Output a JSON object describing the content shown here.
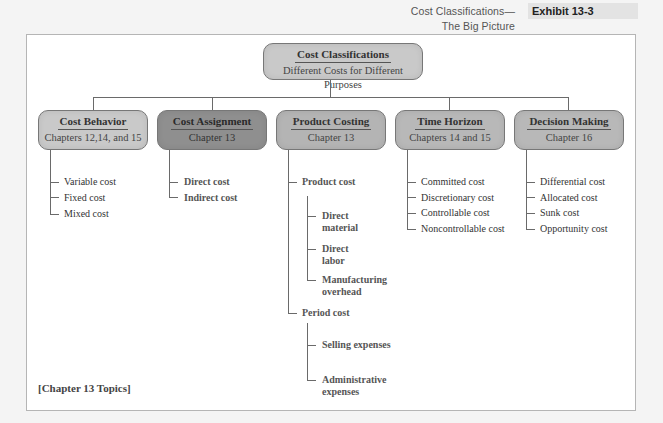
{
  "header": {
    "title": "Cost Classifications—The Big Picture",
    "exhibit": "Exhibit 13-3"
  },
  "root": {
    "title": "Cost Classifications",
    "subtitle": "Different Costs for Different Purposes"
  },
  "categories": [
    {
      "title": "Cost Behavior",
      "subtitle": "Chapters 12,14, and 15",
      "items": [
        "Variable cost",
        "Fixed cost",
        "Mixed cost"
      ]
    },
    {
      "title": "Cost Assignment",
      "subtitle": "Chapter 13",
      "items": [
        "Direct cost",
        "Indirect cost"
      ]
    },
    {
      "title": "Product Costing",
      "subtitle": "Chapter 13",
      "groups": [
        {
          "label": "Product cost",
          "items": [
            "Direct material",
            "Direct labor",
            "Manufacturing overhead"
          ],
          "items_display": [
            [
              "Direct",
              "material"
            ],
            [
              "Direct",
              "labor"
            ],
            [
              "Manufacturing",
              "overhead"
            ]
          ]
        },
        {
          "label": "Period cost",
          "items": [
            "Selling expenses",
            "Administrative expenses"
          ],
          "items_display": [
            [
              "Selling expenses"
            ],
            [
              "Administrative",
              "expenses"
            ]
          ]
        }
      ]
    },
    {
      "title": "Time Horizon",
      "subtitle": "Chapters 14 and 15",
      "items": [
        "Committed cost",
        "Discretionary cost",
        "Controllable cost",
        "Noncontrollable cost"
      ]
    },
    {
      "title": "Decision Making",
      "subtitle": "Chapter 16",
      "items": [
        "Differential cost",
        "Allocated cost",
        "Sunk cost",
        "Opportunity cost"
      ]
    }
  ],
  "footer": {
    "note": "[Chapter 13 Topics]"
  },
  "colors": {
    "box_fill": "#c9c9c9",
    "highlight_box_fill": "#8f8f8f",
    "connector": "#6a6a6a",
    "frame_border": "#b5b5b5"
  }
}
